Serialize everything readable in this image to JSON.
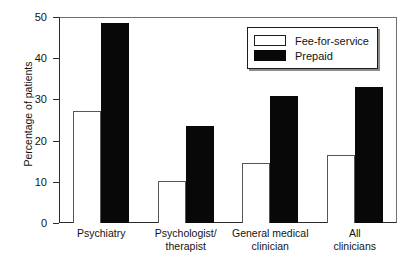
{
  "chart_data": {
    "type": "bar",
    "title": "",
    "xlabel": "",
    "ylabel": "Percentage of patients",
    "ylim": [
      0,
      50
    ],
    "yticks": [
      0,
      10,
      20,
      30,
      40,
      50
    ],
    "ytick_labels": [
      "0",
      "10",
      "20",
      "30",
      "40",
      "50"
    ],
    "grid": false,
    "legend_position": "top-right",
    "categories": [
      "Psychiatry",
      "Psychologist/ therapist",
      "General medical clinician",
      "All clinicians"
    ],
    "category_lines": [
      [
        "Psychiatry"
      ],
      [
        "Psychologist/",
        "therapist"
      ],
      [
        "General medical",
        "clinician"
      ],
      [
        "All",
        "clinicians"
      ]
    ],
    "series": [
      {
        "name": "Fee-for-service",
        "style": "open",
        "color": "#ffffff",
        "edge_color": "#565656",
        "values": [
          27.3,
          10.3,
          14.5,
          16.6
        ]
      },
      {
        "name": "Prepaid",
        "style": "filled",
        "color": "#080808",
        "edge_color": "#080808",
        "values": [
          48.5,
          23.5,
          30.8,
          33.0
        ]
      }
    ]
  },
  "legend": {
    "items": [
      {
        "label": "Fee-for-service",
        "style": "open"
      },
      {
        "label": "Prepaid",
        "style": "filled"
      }
    ]
  }
}
